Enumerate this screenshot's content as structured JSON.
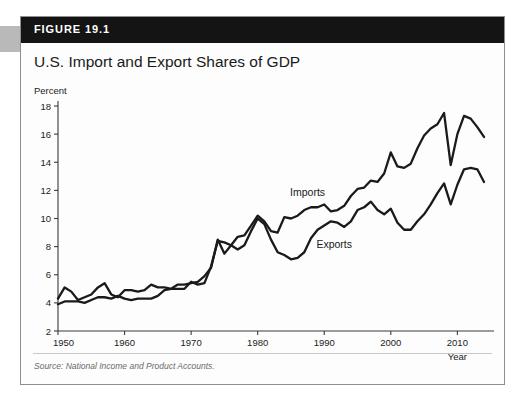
{
  "figure": {
    "number_label": "FIGURE 19.1",
    "title": "U.S. Import and Export Shares of GDP",
    "source_note": "Source: National Income and Product Accounts."
  },
  "chart_data": {
    "type": "line",
    "title": "U.S. Import and Export Shares of GDP",
    "xlabel": "Year",
    "ylabel": "Percent",
    "xlim": [
      1950,
      2014
    ],
    "ylim": [
      2,
      18
    ],
    "ytick_step": 2,
    "yticks": [
      2,
      4,
      6,
      8,
      10,
      12,
      14,
      16,
      18
    ],
    "xticks": [
      1950,
      1960,
      1970,
      1980,
      1990,
      2000,
      2010
    ],
    "grid": false,
    "legend": "inline-annotations",
    "annotations": [
      {
        "text": "Imports",
        "x": 1987.5,
        "y": 11.6
      },
      {
        "text": "Exports",
        "x": 1991.5,
        "y": 7.9
      }
    ],
    "x": [
      1950,
      1951,
      1952,
      1953,
      1954,
      1955,
      1956,
      1957,
      1958,
      1959,
      1960,
      1961,
      1962,
      1963,
      1964,
      1965,
      1966,
      1967,
      1968,
      1969,
      1970,
      1971,
      1972,
      1973,
      1974,
      1975,
      1976,
      1977,
      1978,
      1979,
      1980,
      1981,
      1982,
      1983,
      1984,
      1985,
      1986,
      1987,
      1988,
      1989,
      1990,
      1991,
      1992,
      1993,
      1994,
      1995,
      1996,
      1997,
      1998,
      1999,
      2000,
      2001,
      2002,
      2003,
      2004,
      2005,
      2006,
      2007,
      2008,
      2009,
      2010,
      2011,
      2012,
      2013,
      2014
    ],
    "series": [
      {
        "name": "Imports",
        "color": "#1a1a1a",
        "values": [
          3.9,
          4.1,
          4.1,
          4.1,
          4.0,
          4.2,
          4.4,
          4.4,
          4.3,
          4.5,
          4.3,
          4.2,
          4.3,
          4.3,
          4.3,
          4.5,
          4.9,
          5.0,
          5.3,
          5.3,
          5.4,
          5.5,
          5.9,
          6.5,
          8.5,
          7.5,
          8.1,
          8.7,
          8.8,
          9.5,
          10.2,
          9.8,
          9.1,
          9.0,
          10.1,
          10.0,
          10.2,
          10.6,
          10.8,
          10.8,
          11.0,
          10.5,
          10.6,
          10.9,
          11.6,
          12.1,
          12.2,
          12.7,
          12.6,
          13.2,
          14.7,
          13.7,
          13.6,
          13.9,
          15.0,
          15.9,
          16.4,
          16.7,
          17.5,
          13.8,
          16.0,
          17.3,
          17.1,
          16.5,
          15.8
        ]
      },
      {
        "name": "Exports",
        "color": "#1a1a1a",
        "values": [
          4.3,
          5.1,
          4.8,
          4.2,
          4.4,
          4.6,
          5.1,
          5.4,
          4.6,
          4.4,
          4.9,
          4.9,
          4.8,
          4.9,
          5.3,
          5.1,
          5.1,
          5.0,
          5.0,
          5.0,
          5.5,
          5.3,
          5.4,
          6.6,
          8.4,
          8.3,
          8.1,
          7.8,
          8.1,
          9.1,
          10.0,
          9.6,
          8.5,
          7.6,
          7.4,
          7.1,
          7.2,
          7.6,
          8.6,
          9.2,
          9.5,
          9.8,
          9.7,
          9.4,
          9.8,
          10.6,
          10.8,
          11.2,
          10.6,
          10.3,
          10.7,
          9.7,
          9.2,
          9.2,
          9.8,
          10.3,
          11.0,
          11.8,
          12.5,
          11.0,
          12.4,
          13.5,
          13.6,
          13.5,
          12.6
        ]
      }
    ]
  }
}
